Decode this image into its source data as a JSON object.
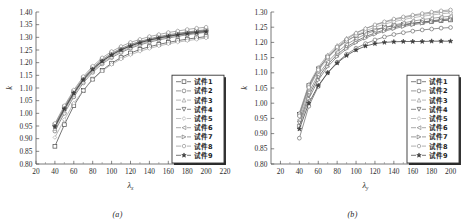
{
  "figure": {
    "panels": [
      {
        "id": "a",
        "subcaption": "(a)",
        "xlabel": "λ",
        "xlabel_sub": "x",
        "ylabel": "k"
      },
      {
        "id": "b",
        "subcaption": "(b)",
        "xlabel": "λ",
        "xlabel_sub": "y",
        "ylabel": "k"
      }
    ]
  },
  "legend": {
    "position": "bottom-right",
    "items": [
      "试件1",
      "试件2",
      "试件3",
      "试件4",
      "试件5",
      "试件6",
      "试件7",
      "试件8",
      "试件9"
    ]
  },
  "colors": {
    "axis": "#555555",
    "text": "#2b2b2b",
    "series": [
      "#4a4a4a",
      "#6e6e6e",
      "#9a9a9a",
      "#5a5a5a",
      "#a8a8a8",
      "#858585",
      "#737373",
      "#8f8f8f",
      "#3c3c3c"
    ]
  },
  "chart_data": [
    {
      "type": "line",
      "title": "",
      "subtitle": "(a)",
      "xlabel": "λx",
      "ylabel": "k",
      "xlim": [
        20,
        220
      ],
      "ylim": [
        0.8,
        1.4
      ],
      "xticks": [
        20,
        40,
        60,
        80,
        100,
        120,
        140,
        160,
        180,
        200,
        220
      ],
      "yticks": [
        0.8,
        0.85,
        0.9,
        0.95,
        1.0,
        1.05,
        1.1,
        1.15,
        1.2,
        1.25,
        1.3,
        1.35,
        1.4
      ],
      "grid": false,
      "legend_position": "lower right",
      "x": [
        40,
        50,
        60,
        70,
        80,
        90,
        100,
        110,
        120,
        130,
        140,
        150,
        160,
        170,
        180,
        190,
        200
      ],
      "series": [
        {
          "name": "试件1",
          "marker": "square",
          "values": [
            0.87,
            0.955,
            1.03,
            1.09,
            1.135,
            1.17,
            1.198,
            1.22,
            1.238,
            1.252,
            1.263,
            1.272,
            1.28,
            1.287,
            1.293,
            1.298,
            1.303
          ]
        },
        {
          "name": "试件2",
          "marker": "circle",
          "values": [
            0.93,
            1.0,
            1.065,
            1.12,
            1.162,
            1.195,
            1.22,
            1.24,
            1.257,
            1.27,
            1.281,
            1.29,
            1.297,
            1.304,
            1.31,
            1.315,
            1.32
          ]
        },
        {
          "name": "试件3",
          "marker": "triangle-up",
          "values": [
            0.94,
            1.01,
            1.073,
            1.127,
            1.168,
            1.2,
            1.225,
            1.245,
            1.261,
            1.274,
            1.285,
            1.294,
            1.301,
            1.308,
            1.313,
            1.318,
            1.323
          ]
        },
        {
          "name": "试件4",
          "marker": "triangle-down",
          "values": [
            0.945,
            1.015,
            1.078,
            1.132,
            1.173,
            1.205,
            1.23,
            1.25,
            1.266,
            1.279,
            1.289,
            1.298,
            1.305,
            1.311,
            1.317,
            1.322,
            1.326
          ]
        },
        {
          "name": "试件5",
          "marker": "diamond",
          "values": [
            0.905,
            0.975,
            1.04,
            1.09,
            1.133,
            1.167,
            1.193,
            1.214,
            1.231,
            1.245,
            1.256,
            1.266,
            1.274,
            1.281,
            1.287,
            1.292,
            1.297
          ]
        },
        {
          "name": "试件6",
          "marker": "left-triangle",
          "values": [
            0.95,
            1.02,
            1.082,
            1.135,
            1.176,
            1.208,
            1.233,
            1.253,
            1.269,
            1.281,
            1.292,
            1.3,
            1.307,
            1.313,
            1.319,
            1.324,
            1.328
          ]
        },
        {
          "name": "试件7",
          "marker": "right-triangle",
          "values": [
            0.955,
            1.025,
            1.086,
            1.139,
            1.18,
            1.212,
            1.237,
            1.256,
            1.272,
            1.284,
            1.294,
            1.303,
            1.31,
            1.316,
            1.321,
            1.326,
            1.33
          ]
        },
        {
          "name": "试件8",
          "marker": "hexagon",
          "values": [
            0.96,
            1.03,
            1.092,
            1.145,
            1.186,
            1.219,
            1.244,
            1.264,
            1.28,
            1.292,
            1.303,
            1.311,
            1.319,
            1.325,
            1.331,
            1.336,
            1.34
          ]
        },
        {
          "name": "试件9",
          "marker": "star",
          "values": [
            0.948,
            1.018,
            1.08,
            1.133,
            1.174,
            1.206,
            1.231,
            1.251,
            1.266,
            1.279,
            1.289,
            1.297,
            1.304,
            1.31,
            1.315,
            1.319,
            1.323
          ]
        }
      ]
    },
    {
      "type": "line",
      "title": "",
      "subtitle": "(b)",
      "xlabel": "λy",
      "ylabel": "k",
      "xlim": [
        10,
        210
      ],
      "ylim": [
        0.8,
        1.3
      ],
      "xticks": [
        20,
        40,
        60,
        80,
        100,
        120,
        140,
        160,
        180,
        200
      ],
      "yticks": [
        0.8,
        0.85,
        0.9,
        0.95,
        1.0,
        1.05,
        1.1,
        1.15,
        1.2,
        1.25,
        1.3
      ],
      "grid": false,
      "legend_position": "lower right",
      "x": [
        40,
        50,
        60,
        70,
        80,
        90,
        100,
        110,
        120,
        130,
        140,
        150,
        160,
        170,
        180,
        190,
        200
      ],
      "series": [
        {
          "name": "试件1",
          "marker": "square",
          "values": [
            0.963,
            1.058,
            1.113,
            1.152,
            1.182,
            1.205,
            1.222,
            1.233,
            1.242,
            1.249,
            1.255,
            1.259,
            1.263,
            1.266,
            1.269,
            1.272,
            1.274
          ]
        },
        {
          "name": "试件2",
          "marker": "circle",
          "values": [
            0.885,
            0.99,
            1.055,
            1.1,
            1.135,
            1.161,
            1.181,
            1.196,
            1.208,
            1.218,
            1.226,
            1.232,
            1.237,
            1.241,
            1.244,
            1.247,
            1.249
          ]
        },
        {
          "name": "试件3",
          "marker": "triangle-up",
          "values": [
            0.968,
            1.062,
            1.118,
            1.159,
            1.19,
            1.214,
            1.232,
            1.246,
            1.257,
            1.266,
            1.274,
            1.281,
            1.287,
            1.292,
            1.296,
            1.3,
            1.303
          ]
        },
        {
          "name": "试件4",
          "marker": "triangle-down",
          "values": [
            0.935,
            1.025,
            1.085,
            1.128,
            1.16,
            1.185,
            1.204,
            1.219,
            1.231,
            1.241,
            1.249,
            1.256,
            1.262,
            1.267,
            1.271,
            1.275,
            1.278
          ]
        },
        {
          "name": "试件5",
          "marker": "diamond",
          "values": [
            0.955,
            1.048,
            1.106,
            1.148,
            1.18,
            1.204,
            1.223,
            1.238,
            1.25,
            1.26,
            1.268,
            1.275,
            1.281,
            1.286,
            1.29,
            1.294,
            1.297
          ]
        },
        {
          "name": "试件6",
          "marker": "left-triangle",
          "values": [
            0.945,
            1.035,
            1.094,
            1.136,
            1.168,
            1.193,
            1.212,
            1.227,
            1.239,
            1.249,
            1.257,
            1.264,
            1.27,
            1.275,
            1.279,
            1.283,
            1.286
          ]
        },
        {
          "name": "试件7",
          "marker": "right-triangle",
          "values": [
            0.925,
            1.015,
            1.076,
            1.12,
            1.153,
            1.179,
            1.199,
            1.214,
            1.227,
            1.237,
            1.245,
            1.252,
            1.258,
            1.263,
            1.267,
            1.271,
            1.274
          ]
        },
        {
          "name": "试件8",
          "marker": "hexagon",
          "values": [
            0.958,
            1.052,
            1.11,
            1.152,
            1.185,
            1.21,
            1.23,
            1.245,
            1.258,
            1.268,
            1.277,
            1.284,
            1.29,
            1.295,
            1.3,
            1.304,
            1.307
          ]
        },
        {
          "name": "试件9",
          "marker": "star",
          "values": [
            0.915,
            1.0,
            1.058,
            1.1,
            1.132,
            1.157,
            1.175,
            1.188,
            1.196,
            1.2,
            1.202,
            1.203,
            1.203,
            1.203,
            1.204,
            1.204,
            1.204
          ]
        }
      ]
    }
  ]
}
